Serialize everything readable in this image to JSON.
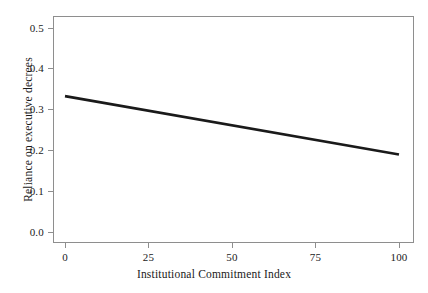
{
  "chart_data": {
    "type": "line",
    "title": "",
    "subtitle": "",
    "xlabel": "Institutional Commitment Index",
    "ylabel": "Reliance on executive decrees",
    "xlim": [
      0,
      100
    ],
    "ylim": [
      0.0,
      0.5
    ],
    "xticks": [
      0,
      25,
      50,
      75,
      100
    ],
    "xtick_labels": [
      "0",
      "25",
      "50",
      "75",
      "100"
    ],
    "yticks": [
      0.0,
      0.1,
      0.2,
      0.3,
      0.4,
      0.5
    ],
    "ytick_labels": [
      "0.0",
      "0.1",
      "0.2",
      "0.3",
      "0.4",
      "0.5"
    ],
    "grid": false,
    "legend": null,
    "legend_position": "none",
    "annotations": [],
    "series": [
      {
        "name": "Predicted reliance on executive decrees",
        "x": [
          0,
          100
        ],
        "values": [
          0.333,
          0.19
        ],
        "color": "#1a1a1a",
        "line_width": 2.6,
        "style": "solid"
      }
    ]
  },
  "figure": {
    "background_color": "#ffffff",
    "frame_color": "#8e8e8e",
    "text_color": "#1a1a1a"
  }
}
